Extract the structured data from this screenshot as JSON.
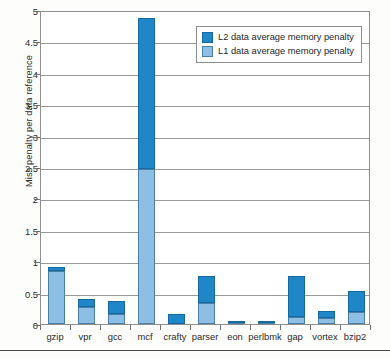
{
  "chart_data": {
    "type": "bar",
    "stacked": true,
    "title": "",
    "xlabel": "",
    "ylabel": "Miss penalty per data reference",
    "ylim": [
      0,
      5
    ],
    "ytick_step": 0.5,
    "yticks": [
      "0",
      "0.5",
      "1",
      "1.5",
      "2",
      "2.5",
      "3",
      "3.5",
      "4",
      "4.5",
      "5"
    ],
    "grid": true,
    "legend_position": "top-right",
    "categories": [
      "gzip",
      "vpr",
      "gcc",
      "mcf",
      "crafty",
      "parser",
      "eon",
      "perlbmk",
      "gap",
      "vortex",
      "bzip2"
    ],
    "series": [
      {
        "name": "L1 data average memory penalty",
        "color": "#8cbfe3",
        "values": [
          0.84,
          0.27,
          0.16,
          2.47,
          0.0,
          0.33,
          0.01,
          0.02,
          0.11,
          0.09,
          0.19
        ]
      },
      {
        "name": "L2 data average memory penalty",
        "color": "#1f86c8",
        "values": [
          0.07,
          0.13,
          0.21,
          2.4,
          0.16,
          0.43,
          0.01,
          0.03,
          0.65,
          0.11,
          0.34
        ]
      }
    ],
    "totals": [
      0.91,
      0.4,
      0.37,
      4.87,
      0.16,
      0.76,
      0.02,
      0.05,
      0.76,
      0.2,
      0.53
    ]
  },
  "legend": {
    "items": [
      {
        "label": "L2 data average memory penalty",
        "color": "#1f86c8"
      },
      {
        "label": "L1 data average memory penalty",
        "color": "#8cbfe3"
      }
    ]
  },
  "axis": {
    "y_title": "Miss penalty per data reference"
  }
}
